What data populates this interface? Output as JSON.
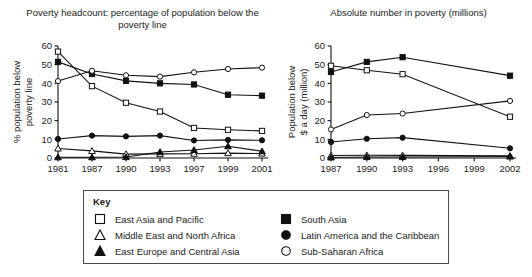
{
  "legend": {
    "title": "Key",
    "column_a": [
      {
        "symbol": "open-square",
        "label": "East Asia and Pacific"
      },
      {
        "symbol": "open-triangle",
        "label": "Middle East and North Africa"
      },
      {
        "symbol": "filled-triangle",
        "label": "East Europe and Central Asia"
      }
    ],
    "column_b": [
      {
        "symbol": "filled-square",
        "label": "South Asia"
      },
      {
        "symbol": "filled-circle",
        "label": "Latin America and the Caribbean"
      },
      {
        "symbol": "open-circle",
        "label": "Sub-Saharan Africa"
      }
    ]
  },
  "chart_data": [
    {
      "type": "line",
      "id": "poverty-headcount",
      "title": "Poverty headcount: percentage of population below the poverty line",
      "xlabel": "",
      "ylabel": "% population below poverty line",
      "ylim": [
        0,
        60
      ],
      "yticks": [
        0,
        10,
        20,
        30,
        40,
        50,
        60
      ],
      "grid": false,
      "legend_position": "below-figure",
      "categories": [
        "1981",
        "1987",
        "1990",
        "1993",
        "1997",
        "1999",
        "2001"
      ],
      "series": [
        {
          "name": "East Asia and Pacific",
          "symbol": "open-square",
          "values": [
            57.0,
            38.5,
            29.6,
            24.9,
            16.1,
            15.1,
            14.5
          ]
        },
        {
          "name": "South Asia",
          "symbol": "filled-square",
          "values": [
            51.5,
            45.0,
            41.3,
            40.0,
            39.4,
            33.9,
            33.4
          ]
        },
        {
          "name": "Latin America and the Caribbean",
          "symbol": "filled-circle",
          "values": [
            10.2,
            12.0,
            11.6,
            12.0,
            9.4,
            9.7,
            9.5
          ]
        },
        {
          "name": "Sub-Saharan Africa",
          "symbol": "open-circle",
          "values": [
            41.2,
            46.7,
            44.3,
            43.6,
            45.9,
            47.7,
            48.4
          ]
        },
        {
          "name": "Middle East and North Africa",
          "symbol": "open-triangle",
          "values": [
            5.1,
            3.8,
            2.1,
            2.2,
            2.3,
            2.6,
            2.4
          ]
        },
        {
          "name": "East Europe and Central Asia",
          "symbol": "filled-triangle",
          "values": [
            0.4,
            0.4,
            0.5,
            3.2,
            4.3,
            6.3,
            3.6
          ]
        }
      ]
    },
    {
      "type": "line",
      "id": "absolute-number-in-poverty",
      "title": "Absolute number in poverty (millions)",
      "xlabel": "",
      "ylabel": "Population below $ a day (million)",
      "ylim": [
        0,
        60
      ],
      "yticks": [
        0,
        10,
        20,
        30,
        40,
        50,
        60
      ],
      "grid": false,
      "legend_position": "below-figure",
      "categories": [
        "1987",
        "1990",
        "1993",
        "1996",
        "1999",
        "2002"
      ],
      "marker_categories": [
        "1987",
        "1990",
        "1993",
        "2002"
      ],
      "series": [
        {
          "name": "East Asia and Pacific",
          "symbol": "open-square",
          "x": [
            "1987",
            "1990",
            "1993",
            "2002"
          ],
          "values": [
            49.4,
            47.0,
            44.9,
            22.1
          ]
        },
        {
          "name": "South Asia",
          "symbol": "filled-square",
          "x": [
            "1987",
            "1990",
            "1993",
            "2002"
          ],
          "values": [
            46.1,
            51.5,
            54.0,
            44.1
          ]
        },
        {
          "name": "Sub-Saharan Africa",
          "symbol": "open-circle",
          "x": [
            "1987",
            "1990",
            "1993",
            "2002"
          ],
          "values": [
            15.3,
            23.0,
            23.8,
            30.6
          ]
        },
        {
          "name": "Latin America and the Caribbean",
          "symbol": "filled-circle",
          "x": [
            "1987",
            "1990",
            "1993",
            "2002"
          ],
          "values": [
            8.6,
            10.3,
            10.9,
            5.2
          ]
        },
        {
          "name": "Middle East and North Africa",
          "symbol": "open-triangle",
          "x": [
            "1987",
            "1990",
            "1993",
            "2002"
          ],
          "values": [
            1.3,
            1.5,
            1.4,
            1.2
          ]
        },
        {
          "name": "East Europe and Central Asia",
          "symbol": "filled-triangle",
          "x": [
            "1987",
            "1990",
            "1993",
            "2002"
          ],
          "values": [
            0.3,
            0.5,
            0.5,
            0.8
          ]
        }
      ]
    }
  ]
}
